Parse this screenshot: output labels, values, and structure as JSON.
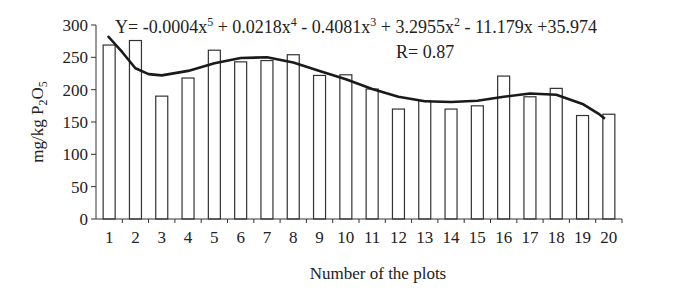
{
  "chart_data": {
    "type": "bar",
    "title": "",
    "xlabel": "Number of the plots",
    "ylabel": "mg/kg P2O5",
    "ylabel_parts": {
      "main": "mg/kg P",
      "sub1": "2",
      "mid": "O",
      "sub2": "5"
    },
    "categories": [
      "1",
      "2",
      "3",
      "4",
      "5",
      "6",
      "7",
      "8",
      "9",
      "10",
      "11",
      "12",
      "13",
      "14",
      "15",
      "16",
      "17",
      "18",
      "19",
      "20"
    ],
    "values": [
      269,
      276,
      190,
      218,
      261,
      243,
      245,
      254,
      222,
      223,
      201,
      170,
      183,
      170,
      175,
      221,
      189,
      202,
      160,
      162
    ],
    "ylim": [
      0,
      300
    ],
    "yticks": [
      0,
      50,
      100,
      150,
      200,
      250,
      300
    ],
    "grid": false,
    "legend": null,
    "trendline": {
      "type": "polynomial",
      "order": 5,
      "coefficients": [
        -0.0004,
        0.0218,
        -0.4081,
        3.2955,
        -11.179,
        35.974
      ],
      "equation_text": {
        "prefix": "Y= -0.0004x",
        "e1": "5",
        "t2": " + 0.0218x",
        "e2": "4",
        "t3": " - 0.4081x",
        "e3": "3",
        "t4": " + 3.2955x",
        "e4": "2",
        "t5": " - 11.179x +35.974"
      },
      "r_text": "R= 0.87",
      "note": "Fitted curve drawn visually scaled (equation as printed in figure)"
    },
    "colors": {
      "bar_fill": "#ffffff",
      "bar_stroke": "#333333",
      "trend": "#1a1a1a",
      "axis": "#333333"
    }
  }
}
